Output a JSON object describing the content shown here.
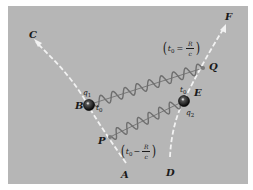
{
  "colors": {
    "background": "#ffffff",
    "panel": "#b6b6b6",
    "worldline": "#f2f2f2",
    "wave": "#6e6e6e",
    "wave_axis": "#3a3a3a",
    "charge": "#111111",
    "event_point": "#7a7a7a",
    "text": "#1a1a1a"
  },
  "worldlines": [
    {
      "id": "left",
      "start_label": "A",
      "end_label": "C"
    },
    {
      "id": "right",
      "start_label": "D",
      "end_label": "F"
    }
  ],
  "charges": [
    {
      "id": "q1",
      "label": "q",
      "subscript": "1",
      "event_label": "B",
      "time_label": "t",
      "time_subscript": "0"
    },
    {
      "id": "q2",
      "label": "q",
      "subscript": "2",
      "event_label": "E",
      "time_label": "t",
      "time_subscript": "0"
    }
  ],
  "points": [
    {
      "label": "P"
    },
    {
      "label": "Q"
    }
  ],
  "annotations": {
    "upper": {
      "var": "t",
      "sub": "0",
      "op": "=",
      "num": "R",
      "den": "c"
    },
    "lower": {
      "var": "t",
      "sub": "0",
      "op": "−",
      "num": "R",
      "den": "c"
    }
  },
  "waves": [
    {
      "from": "B",
      "to": "Q"
    },
    {
      "from": "P",
      "to": "E"
    }
  ]
}
